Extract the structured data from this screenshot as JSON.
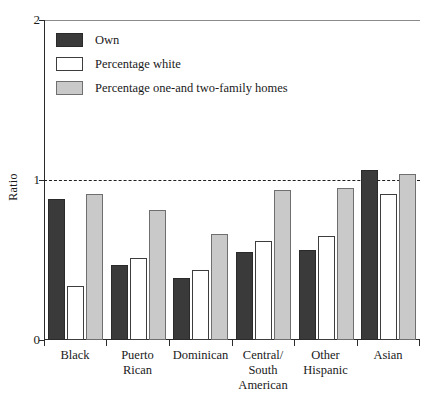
{
  "chart_data": {
    "type": "bar",
    "title": "",
    "xlabel": "",
    "ylabel": "Ratio",
    "ylim": [
      0,
      2
    ],
    "yticks": [
      "0",
      "1",
      "2"
    ],
    "grid": "dashed reference line at y = 1",
    "legend_position": "inside top-left",
    "categories": [
      "Black",
      "Puerto\nRican",
      "Dominican",
      "Central/\nSouth\nAmerican",
      "Other\nHispanic",
      "Asian"
    ],
    "series": [
      {
        "name": "Own",
        "color": "#3a3a3a",
        "values": [
          0.88,
          0.47,
          0.39,
          0.55,
          0.56,
          1.06
        ]
      },
      {
        "name": "Percentage white",
        "color": "#ffffff",
        "values": [
          0.34,
          0.51,
          0.44,
          0.62,
          0.65,
          0.91
        ]
      },
      {
        "name": "Percentage one-and two-family homes",
        "color": "#c9c9c9",
        "values": [
          0.91,
          0.81,
          0.66,
          0.94,
          0.95,
          1.04
        ]
      }
    ],
    "reference_line": 1
  },
  "axis": {
    "y_label": "Ratio",
    "y_tick_top": "2",
    "y_tick_mid": "1",
    "y_tick_bottom": "0"
  },
  "legend": {
    "items": [
      {
        "label": "Own",
        "swatch": "own"
      },
      {
        "label": "Percentage white",
        "swatch": "white"
      },
      {
        "label": "Percentage one-and two-family homes",
        "swatch": "gray"
      }
    ]
  },
  "categories": {
    "c0": "Black",
    "c1": "Puerto\nRican",
    "c2": "Dominican",
    "c3": "Central/\nSouth\nAmerican",
    "c4": "Other\nHispanic",
    "c5": "Asian"
  }
}
